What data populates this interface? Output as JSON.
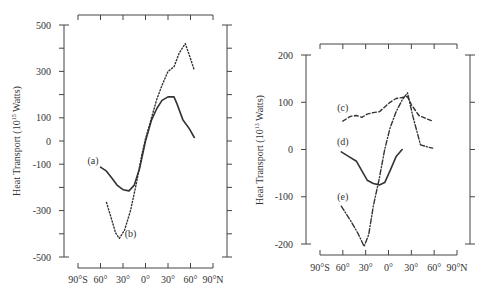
{
  "chart_data": [
    {
      "type": "line",
      "panel": "left",
      "title": "",
      "xlabel": "",
      "ylabel": "Heat Transport (10^15 Watts)",
      "ylabel_parts": {
        "pre": "Heat Transport (10",
        "sup": "15",
        "post": " Watts)"
      },
      "ylim": [
        -500,
        500
      ],
      "yticks": [
        500,
        300,
        100,
        0,
        -100,
        -300,
        -500
      ],
      "yticks_minor": [
        400,
        200,
        -200,
        -400
      ],
      "xlim": [
        -90,
        90
      ],
      "xtick_labels": [
        "90°S",
        "60°",
        "30°",
        "0°",
        "30°",
        "60°",
        "90°N"
      ],
      "xticks": [
        -90,
        -60,
        -30,
        0,
        30,
        60,
        90
      ],
      "grid": false,
      "series": [
        {
          "name": "(a)",
          "style": "solid",
          "x": [
            -60,
            -52,
            -45,
            -38,
            -30,
            -22,
            -15,
            -8,
            0,
            8,
            15,
            22,
            30,
            38,
            42,
            50,
            58,
            65
          ],
          "y": [
            -113,
            -130,
            -160,
            -190,
            -210,
            -215,
            -190,
            -120,
            0,
            90,
            140,
            175,
            190,
            190,
            160,
            90,
            55,
            15
          ]
        },
        {
          "name": "(b)",
          "style": "dotted",
          "x": [
            -52,
            -45,
            -40,
            -35,
            -28,
            -20,
            -12,
            -5,
            0,
            8,
            15,
            22,
            30,
            38,
            45,
            53,
            60,
            65
          ],
          "y": [
            -265,
            -340,
            -395,
            -420,
            -385,
            -300,
            -180,
            -60,
            10,
            100,
            180,
            240,
            300,
            320,
            380,
            420,
            355,
            305
          ]
        }
      ],
      "annotations": [
        {
          "text": "(a)",
          "x": -70,
          "y": -85
        },
        {
          "text": "(b)",
          "x": -20,
          "y": -400
        }
      ]
    },
    {
      "type": "line",
      "panel": "right",
      "title": "",
      "xlabel": "",
      "ylabel": "Heat Transport (10^13 Watts)",
      "ylabel_parts": {
        "pre": "Heat Transport (10",
        "sup": "13",
        "post": " Watts)"
      },
      "ylim": [
        -200,
        200
      ],
      "yticks": [
        200,
        100,
        0,
        -100,
        -200
      ],
      "xlim": [
        -90,
        90
      ],
      "xtick_labels": [
        "90°S",
        "60°",
        "30°",
        "0°",
        "30°",
        "60°",
        "90°N"
      ],
      "xticks": [
        -90,
        -60,
        -30,
        0,
        30,
        60,
        90
      ],
      "grid": false,
      "series": [
        {
          "name": "(c)",
          "style": "dashed",
          "x": [
            -60,
            -50,
            -42,
            -35,
            -28,
            -20,
            -12,
            -5,
            2,
            10,
            18,
            25,
            30,
            40,
            50,
            58
          ],
          "y": [
            60,
            70,
            72,
            68,
            75,
            78,
            80,
            90,
            100,
            108,
            110,
            112,
            95,
            72,
            65,
            60
          ]
        },
        {
          "name": "(d)",
          "style": "solid",
          "x": [
            -62,
            -52,
            -42,
            -35,
            -28,
            -20,
            -12,
            -5,
            2,
            10,
            18
          ],
          "y": [
            -5,
            -15,
            -25,
            -45,
            -65,
            -72,
            -75,
            -70,
            -45,
            -15,
            0
          ]
        },
        {
          "name": "(e)",
          "style": "dashdot",
          "x": [
            -62,
            -50,
            -40,
            -32,
            -26,
            -20,
            -12,
            -5,
            2,
            10,
            18,
            25,
            32,
            42,
            52,
            58
          ],
          "y": [
            -120,
            -150,
            -178,
            -205,
            -180,
            -120,
            -60,
            0,
            45,
            80,
            105,
            120,
            70,
            10,
            5,
            3
          ]
        }
      ],
      "annotations": [
        {
          "text": "(c)",
          "x": -60,
          "y": 88
        },
        {
          "text": "(d)",
          "x": -60,
          "y": 15
        },
        {
          "text": "(e)",
          "x": -60,
          "y": -100
        }
      ]
    }
  ]
}
